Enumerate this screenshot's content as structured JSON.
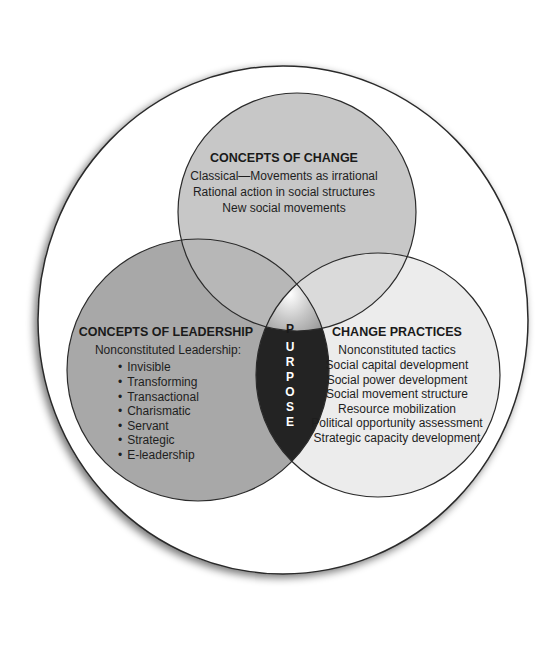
{
  "diagram": {
    "type": "venn",
    "center_label": "PURPOSE",
    "center_letters": [
      "P",
      "U",
      "R",
      "P",
      "O",
      "S",
      "E"
    ],
    "circles": {
      "top": {
        "title": "CONCEPTS OF CHANGE",
        "items": [
          "Classical—Movements as irrational",
          "Rational action in social structures",
          "New social movements"
        ]
      },
      "left": {
        "title": "CONCEPTS OF LEADERSHIP",
        "subtitle": "Nonconstituted Leadership:",
        "items": [
          "Invisible",
          "Transforming",
          "Transactional",
          "Charismatic",
          "Servant",
          "Strategic",
          "E-leadership"
        ]
      },
      "right": {
        "title": "CHANGE PRACTICES",
        "items": [
          "Nonconstituted tactics",
          "Social capital development",
          "Social power development",
          "Social movement structure",
          "Resource mobilization",
          "Political opportunity assessment",
          "Strategic capacity development"
        ]
      }
    },
    "colors": {
      "outer_fill": "#ffffff",
      "outline": "#2b2b2b",
      "top_fill": "#c7c7c7",
      "left_fill": "#a8a8a8",
      "right_fill": "#ececec",
      "purpose_dark": "#232323",
      "purpose_cap": "#9a9a9a"
    },
    "bullet": "•"
  }
}
